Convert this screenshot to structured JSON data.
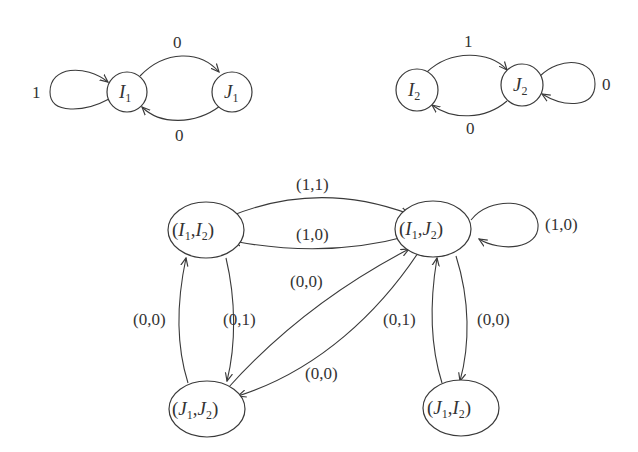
{
  "diagram": {
    "type": "state-transition-graphs",
    "colors": {
      "stroke": "#3a3a3a",
      "text": "#333333",
      "background": "#ffffff"
    },
    "automaton1": {
      "states": [
        {
          "id": "I1",
          "name": "I",
          "sub": "1"
        },
        {
          "id": "J1",
          "name": "J",
          "sub": "1"
        }
      ],
      "edges": [
        {
          "from": "I1",
          "to": "I1",
          "label": "1"
        },
        {
          "from": "I1",
          "to": "J1",
          "label": "0"
        },
        {
          "from": "J1",
          "to": "I1",
          "label": "0"
        }
      ]
    },
    "automaton2": {
      "states": [
        {
          "id": "I2",
          "name": "I",
          "sub": "2"
        },
        {
          "id": "J2",
          "name": "J",
          "sub": "2"
        }
      ],
      "edges": [
        {
          "from": "I2",
          "to": "J2",
          "label": "1"
        },
        {
          "from": "J2",
          "to": "I2",
          "label": "0"
        },
        {
          "from": "J2",
          "to": "J2",
          "label": "0"
        }
      ]
    },
    "product": {
      "states": [
        {
          "id": "I1I2",
          "a": "I",
          "a_sub": "1",
          "b": "I",
          "b_sub": "2"
        },
        {
          "id": "I1J2",
          "a": "I",
          "a_sub": "1",
          "b": "J",
          "b_sub": "2"
        },
        {
          "id": "J1J2",
          "a": "J",
          "a_sub": "1",
          "b": "J",
          "b_sub": "2"
        },
        {
          "id": "J1I2",
          "a": "J",
          "a_sub": "1",
          "b": "I",
          "b_sub": "2"
        }
      ],
      "edges": [
        {
          "from": "I1I2",
          "to": "I1J2",
          "label": "(1,1)"
        },
        {
          "from": "I1J2",
          "to": "I1I2",
          "label": "(1,0)"
        },
        {
          "from": "I1J2",
          "to": "I1J2",
          "label": "(1,0)"
        },
        {
          "from": "J1J2",
          "to": "I1I2",
          "label": "(0,0)"
        },
        {
          "from": "I1I2",
          "to": "J1J2",
          "label": "(0,1)"
        },
        {
          "from": "J1J2",
          "to": "I1J2",
          "label": "(0,0)"
        },
        {
          "from": "I1J2",
          "to": "J1J2",
          "label": "(0,0)"
        },
        {
          "from": "J1I2",
          "to": "I1J2",
          "label": "(0,1)"
        },
        {
          "from": "I1J2",
          "to": "J1I2",
          "label": "(0,0)"
        }
      ]
    }
  }
}
